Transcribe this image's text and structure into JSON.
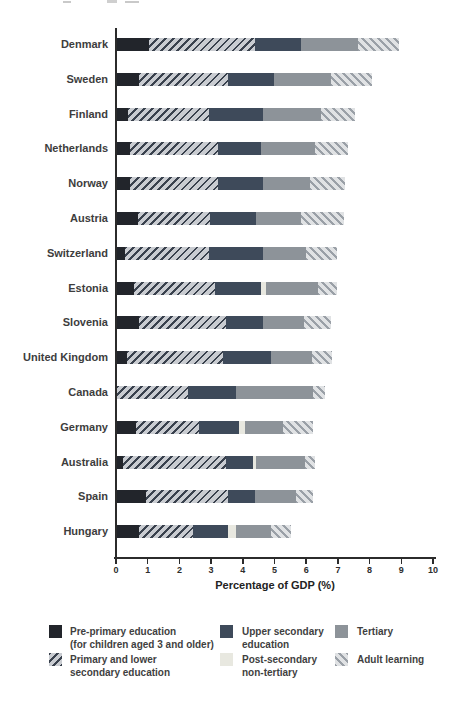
{
  "chart_data": {
    "type": "bar",
    "orientation": "horizontal-stacked",
    "title": "",
    "xlabel": "Percentage of GDP (%)",
    "xlim": [
      0,
      10
    ],
    "xticks": [
      0,
      1,
      2,
      3,
      4,
      5,
      6,
      7,
      8,
      9,
      10
    ],
    "grid": false,
    "legend_position": "bottom",
    "categories": [
      "Denmark",
      "Sweden",
      "Finland",
      "Netherlands",
      "Norway",
      "Austria",
      "Switzerland",
      "Estonia",
      "Slovenia",
      "United Kingdom",
      "Canada",
      "Germany",
      "Australia",
      "Spain",
      "Hungary"
    ],
    "series": [
      {
        "name": "Pre-primary education (for children aged 3 and older)",
        "style": "solid",
        "color": "#22252b",
        "values": [
          1.0,
          0.7,
          0.35,
          0.4,
          0.4,
          0.65,
          0.25,
          0.55,
          0.7,
          0.3,
          0,
          0.6,
          0.2,
          0.9,
          0.7
        ]
      },
      {
        "name": "Primary and lower secondary education",
        "style": "hatch-fwd",
        "color": "",
        "values": [
          3.35,
          2.8,
          2.55,
          2.8,
          2.8,
          2.3,
          2.65,
          2.55,
          2.75,
          3.05,
          2.25,
          2.0,
          3.25,
          2.6,
          1.7
        ]
      },
      {
        "name": "Upper secondary education",
        "style": "solid",
        "color": "#3e4a5a",
        "values": [
          1.45,
          1.45,
          1.7,
          1.35,
          1.4,
          1.45,
          1.7,
          1.45,
          1.15,
          1.5,
          1.5,
          1.25,
          0.85,
          0.85,
          1.1
        ]
      },
      {
        "name": "Post-secondary non-tertiary",
        "style": "solid",
        "color": "#e8e8e0",
        "values": [
          0,
          0,
          0,
          0,
          0,
          0,
          0,
          0.15,
          0,
          0,
          0,
          0.2,
          0.1,
          0,
          0.25
        ]
      },
      {
        "name": "Tertiary",
        "style": "solid",
        "color": "#8d9399",
        "values": [
          1.8,
          1.8,
          1.85,
          1.7,
          1.5,
          1.4,
          1.35,
          1.65,
          1.3,
          1.3,
          2.45,
          1.2,
          1.55,
          1.3,
          1.1
        ]
      },
      {
        "name": "Adult learning",
        "style": "hatch-back",
        "color": "",
        "values": [
          1.3,
          1.3,
          1.05,
          1.05,
          1.1,
          1.35,
          1.0,
          0.6,
          0.85,
          0.65,
          0.35,
          0.95,
          0.3,
          0.55,
          0.65
        ]
      }
    ],
    "legend": {
      "items": [
        {
          "lines": [
            "Pre-primary education",
            "(for children aged 3 and older)"
          ],
          "style": "solid",
          "color": "#22252b",
          "col": 0,
          "row": 0
        },
        {
          "lines": [
            "Primary and lower",
            "secondary education"
          ],
          "style": "hatch-fwd",
          "color": "",
          "col": 0,
          "row": 1
        },
        {
          "lines": [
            "Upper secondary",
            "education"
          ],
          "style": "solid",
          "color": "#3e4a5a",
          "col": 1,
          "row": 0
        },
        {
          "lines": [
            "Post-secondary",
            "non-tertiary"
          ],
          "style": "solid",
          "color": "#e8e8e0",
          "col": 1,
          "row": 1
        },
        {
          "lines": [
            "Tertiary"
          ],
          "style": "solid",
          "color": "#8d9399",
          "col": 2,
          "row": 0
        },
        {
          "lines": [
            "Adult learning"
          ],
          "style": "hatch-back",
          "color": "",
          "col": 2,
          "row": 1
        }
      ]
    },
    "colors": {
      "axis": "#2b2b2b",
      "label_text": "#3d3d3d",
      "pre_primary": "#22252b",
      "upper_secondary": "#3e4a5a",
      "post_secondary": "#e8e8e0",
      "tertiary": "#8d9399",
      "hatch_dark_line": "#39414d",
      "hatch_dark_bg": "#c9ccd1",
      "hatch_light_line": "#9aa0a7",
      "hatch_light_bg": "#e0e2e4"
    }
  }
}
